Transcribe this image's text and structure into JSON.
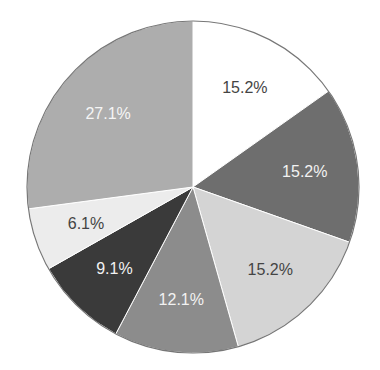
{
  "chart_data": {
    "type": "pie",
    "title": "",
    "start_angle": "12 o'clock",
    "direction": "clockwise",
    "slices": [
      {
        "label": "15.2%",
        "value": 15.2,
        "color": "#ffffff",
        "text_color": "#444444"
      },
      {
        "label": "15.2%",
        "value": 15.2,
        "color": "#6e6e6e",
        "text_color": "#f2f2f2"
      },
      {
        "label": "15.2%",
        "value": 15.2,
        "color": "#d4d4d4",
        "text_color": "#444444"
      },
      {
        "label": "12.1%",
        "value": 12.1,
        "color": "#8c8c8c",
        "text_color": "#f2f2f2"
      },
      {
        "label": "9.1%",
        "value": 9.1,
        "color": "#3a3a3a",
        "text_color": "#f2f2f2"
      },
      {
        "label": "6.1%",
        "value": 6.1,
        "color": "#ececec",
        "text_color": "#444444"
      },
      {
        "label": "27.1%",
        "value": 27.1,
        "color": "#adadad",
        "text_color": "#f5f5f5"
      }
    ],
    "values": [
      15.2,
      15.2,
      15.2,
      12.1,
      9.1,
      6.1,
      27.1
    ],
    "categories": [
      "15.2%",
      "15.2%",
      "15.2%",
      "12.1%",
      "9.1%",
      "6.1%",
      "27.1%"
    ],
    "legend": "none",
    "outline_color": "#777777"
  }
}
